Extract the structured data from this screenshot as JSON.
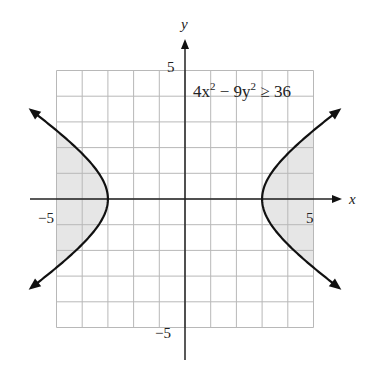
{
  "chart_data": {
    "type": "line",
    "title": "",
    "xlabel": "x",
    "ylabel": "y",
    "xlim": [
      -5,
      5
    ],
    "ylim": [
      -5,
      5
    ],
    "grid": true,
    "grid_step": 1,
    "x_tick_labels": [
      {
        "value": -5,
        "label": "−5"
      },
      {
        "value": 5,
        "label": "5"
      }
    ],
    "y_tick_labels": [
      {
        "value": 5,
        "label": "5"
      },
      {
        "value": -5,
        "label": "−5"
      }
    ],
    "annotation": {
      "text_parts": [
        "4x",
        "2",
        " − 9y",
        "2",
        " ≥ 36"
      ],
      "full": "4x^2 - 9y^2 ≥ 36"
    },
    "series": [
      {
        "name": "right branch",
        "equation": "x^2/9 - y^2/4 = 1, x>0",
        "vertex": [
          3,
          0
        ],
        "points": [
          [
            5.9,
            3.39
          ],
          [
            5,
            2.67
          ],
          [
            4,
            1.76
          ],
          [
            3.5,
            1.2
          ],
          [
            3,
            0
          ],
          [
            3.5,
            -1.2
          ],
          [
            4,
            -1.76
          ],
          [
            5,
            -2.67
          ],
          [
            5.9,
            -3.39
          ]
        ]
      },
      {
        "name": "left branch",
        "equation": "x^2/9 - y^2/4 = 1, x<0",
        "vertex": [
          -3,
          0
        ],
        "points": [
          [
            -5.9,
            3.39
          ],
          [
            -5,
            2.67
          ],
          [
            -4,
            1.76
          ],
          [
            -3.5,
            1.2
          ],
          [
            -3,
            0
          ],
          [
            -3.5,
            -1.2
          ],
          [
            -4,
            -1.76
          ],
          [
            -5,
            -2.67
          ],
          [
            -5.9,
            -3.39
          ]
        ]
      }
    ],
    "shaded_region": "outside both branches within grid (4x^2 - 9y^2 >= 36)",
    "shade_color": "#e6e6e6",
    "curve_color": "#111111",
    "grid_color": "#b8b8b8"
  }
}
